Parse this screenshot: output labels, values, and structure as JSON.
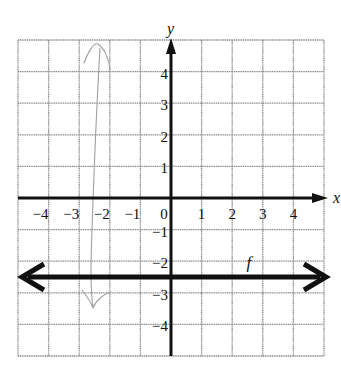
{
  "chart_data": {
    "type": "line",
    "title": "",
    "xlabel": "x",
    "ylabel": "y",
    "xlim": [
      -5,
      5
    ],
    "ylim": [
      -5,
      5
    ],
    "grid": true,
    "x_ticks": [
      -4,
      -3,
      -2,
      -1,
      0,
      1,
      2,
      3,
      4
    ],
    "x_tick_labels": [
      "−4",
      "−3",
      "−2",
      "−1",
      "0",
      "1",
      "2",
      "3",
      "4"
    ],
    "y_ticks": [
      4,
      3,
      2,
      1,
      -1,
      -2,
      -3,
      -4
    ],
    "y_tick_labels": [
      "4",
      "3",
      "2",
      "1",
      "−1",
      "−2",
      "−3",
      "−4"
    ],
    "series": [
      {
        "name": "f",
        "kind": "horizontal line with arrows on both ends",
        "x": [
          -5,
          5
        ],
        "y": [
          -2.5,
          -2.5
        ],
        "equation": "f(x) = -2.5"
      }
    ],
    "annotations": [
      {
        "text": "f",
        "x": 2.6,
        "y": -2.1
      }
    ],
    "pencil_mark": {
      "description": "faint hand-drawn pencil stroke near x = -2.7, spanning from about y = 4.9 down to y = -3.5",
      "color": "#9a9a9a"
    }
  },
  "colors": {
    "grid": "#8c8c8c",
    "axes": "#111111",
    "function_line": "#111111",
    "pencil": "#a0a0a0",
    "background": "#ffffff"
  }
}
